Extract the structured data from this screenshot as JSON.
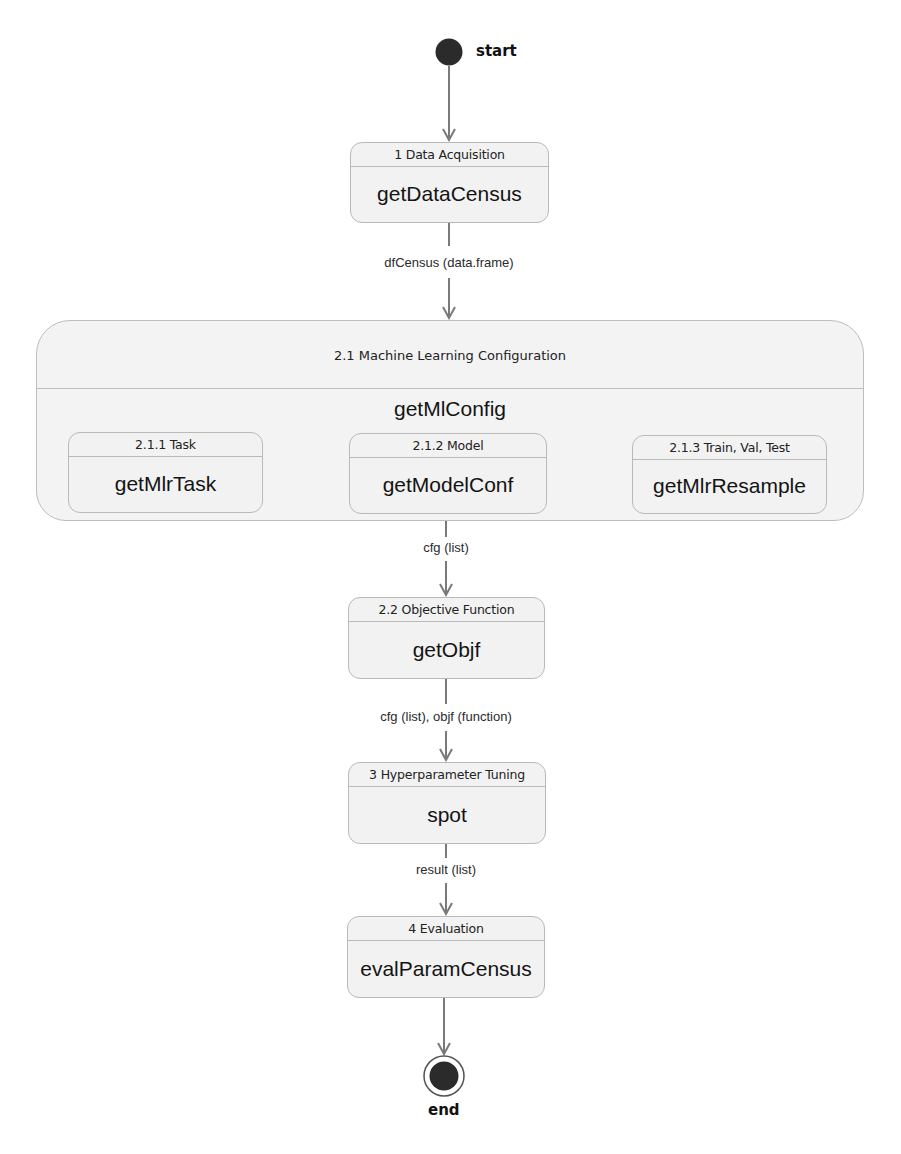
{
  "diagram": {
    "type": "activity-flow",
    "start": {
      "label": "start"
    },
    "end": {
      "label": "end"
    },
    "nodes": [
      {
        "id": "data-acquisition",
        "header": "1 Data Acquisition",
        "function": "getDataCensus"
      },
      {
        "id": "objective-function",
        "header": "2.2 Objective Function",
        "function": "getObjf"
      },
      {
        "id": "hyperparameter-tuning",
        "header": "3 Hyperparameter Tuning",
        "function": "spot"
      },
      {
        "id": "evaluation",
        "header": "4 Evaluation",
        "function": "evalParamCensus"
      }
    ],
    "composite": {
      "header": "2.1 Machine Learning Configuration",
      "function": "getMlConfig",
      "children": [
        {
          "id": "task",
          "header": "2.1.1 Task",
          "function": "getMlrTask"
        },
        {
          "id": "model",
          "header": "2.1.2 Model",
          "function": "getModelConf"
        },
        {
          "id": "resample",
          "header": "2.1.3 Train, Val, Test",
          "function": "getMlrResample"
        }
      ]
    },
    "edges": [
      {
        "from": "start",
        "to": "data-acquisition",
        "label": ""
      },
      {
        "from": "data-acquisition",
        "to": "composite",
        "label": "dfCensus (data.frame)"
      },
      {
        "from": "task",
        "to": "model",
        "label": ""
      },
      {
        "from": "model",
        "to": "resample",
        "label": ""
      },
      {
        "from": "composite",
        "to": "objective-function",
        "label": "cfg (list)"
      },
      {
        "from": "objective-function",
        "to": "hyperparameter-tuning",
        "label": "cfg (list), objf (function)"
      },
      {
        "from": "hyperparameter-tuning",
        "to": "evaluation",
        "label": "result (list)"
      },
      {
        "from": "evaluation",
        "to": "end",
        "label": ""
      }
    ]
  },
  "colors": {
    "node_fill": "#f2f2f2",
    "node_border": "#b9b9b9",
    "edge": "#7a7a7a",
    "state_fill": "#2b2b2b"
  }
}
